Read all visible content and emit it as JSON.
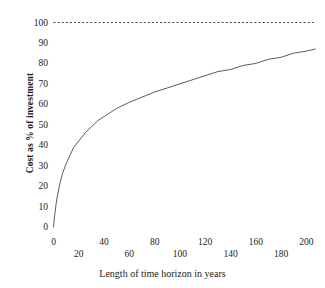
{
  "chart_data": {
    "type": "line",
    "title": "",
    "xlabel": "Length of time horizon in years",
    "ylabel": "Cost as % of investment",
    "xlim": [
      0,
      210
    ],
    "ylim": [
      0,
      100
    ],
    "grid": false,
    "legend": "none",
    "xticks": [
      0,
      20,
      40,
      60,
      80,
      100,
      120,
      140,
      160,
      180,
      200
    ],
    "xtick_labels": [
      "0",
      "20",
      "40",
      "60",
      "80",
      "100",
      "120",
      "140",
      "160",
      "180",
      "200"
    ],
    "xtick_rows": [
      0,
      1,
      0,
      1,
      0,
      1,
      0,
      1,
      0,
      1,
      0
    ],
    "yticks": [
      0,
      10,
      20,
      30,
      40,
      50,
      60,
      70,
      80,
      90,
      100
    ],
    "ytick_labels": [
      "0",
      "10",
      "20",
      "30",
      "40",
      "50",
      "60",
      "70",
      "80",
      "90",
      "100"
    ],
    "series": [
      {
        "name": "Cost as % of investment",
        "style": "solid",
        "color": "#4a4a4a",
        "x": [
          0,
          1,
          2,
          3,
          5,
          7,
          10,
          13,
          16,
          20,
          25,
          30,
          35,
          40,
          50,
          60,
          68,
          80,
          90,
          100,
          110,
          120,
          130,
          140,
          150,
          160,
          170,
          180,
          190,
          200,
          207
        ],
        "y": [
          0,
          6,
          11,
          15,
          21,
          26,
          31,
          35,
          39,
          42,
          46,
          49,
          52,
          54,
          58,
          61,
          63,
          66,
          68,
          70,
          72,
          74,
          76,
          77,
          79,
          80,
          82,
          83,
          85,
          86,
          87
        ]
      },
      {
        "name": "asymptote",
        "style": "dotted",
        "color": "#2a2a2a",
        "x": [
          0,
          207
        ],
        "y": [
          100,
          100
        ]
      }
    ],
    "annotations": [
      {
        "text": "asymptote at 100% of investment",
        "value": 100
      }
    ]
  },
  "axes": {
    "y_title": "Cost as % of investment",
    "x_title": "Length of time horizon in years"
  }
}
